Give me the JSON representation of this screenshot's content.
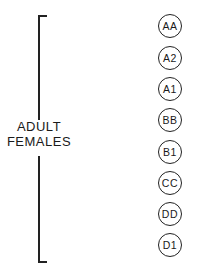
{
  "group": {
    "label_line1": "ADULT",
    "label_line2": "FEMALES"
  },
  "nodes": [
    {
      "label": "AA"
    },
    {
      "label": "A2"
    },
    {
      "label": "A1"
    },
    {
      "label": "BB"
    },
    {
      "label": "B1"
    },
    {
      "label": "CC"
    },
    {
      "label": "DD"
    },
    {
      "label": "D1"
    }
  ],
  "colors": {
    "line": "#222222",
    "background": "#ffffff"
  }
}
